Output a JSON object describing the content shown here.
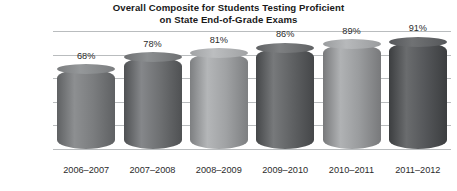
{
  "chart_data": {
    "type": "bar",
    "title": "Overall Composite for Students Testing Proficient on State End-of-Grade Exams",
    "title_lines": [
      "Overall Composite for Students Testing Proficient",
      "on State End-of-Grade Exams"
    ],
    "xlabel": "",
    "ylabel": "",
    "categories": [
      "2006–2007",
      "2007–2008",
      "2008–2009",
      "2009–2010",
      "2010–2011",
      "2011–2012"
    ],
    "values": [
      68,
      78,
      81,
      86,
      89,
      91
    ],
    "data_labels": [
      "68%",
      "78%",
      "81%",
      "86%",
      "89%",
      "91%"
    ],
    "ylim": [
      0,
      100
    ],
    "ytick_values": [
      0,
      20,
      40,
      60,
      80,
      100
    ],
    "ytick_labels": [
      "0%",
      "20%",
      "40%",
      "60%",
      "80%",
      "100%"
    ],
    "grid": true,
    "grid_color": "#b9bcbe",
    "legend": null,
    "legend_position": "none",
    "bar_style": "cylinder",
    "series": [
      {
        "name": "Overall Composite Percent Proficient",
        "values": [
          68,
          78,
          81,
          86,
          89,
          91
        ]
      }
    ],
    "bar_colors": [
      {
        "light": "#8d8f91",
        "mid": "#7b7d7f",
        "dark": "#5f6163",
        "cap": "#95989a"
      },
      {
        "light": "#85878a",
        "mid": "#6e7072",
        "dark": "#4f5153",
        "cap": "#8c8f91"
      },
      {
        "light": "#b4b6b8",
        "mid": "#a0a2a4",
        "dark": "#7d7f81",
        "cap": "#bcbec0"
      },
      {
        "light": "#77797b",
        "mid": "#606264",
        "dark": "#454749",
        "cap": "#7e8082",
        "hasShine": true
      },
      {
        "light": "#b0b2b4",
        "mid": "#9a9c9e",
        "dark": "#78797b",
        "cap": "#b7b9bb"
      },
      {
        "light": "#6a6c6e",
        "mid": "#55575a",
        "dark": "#3c3e40",
        "cap": "#707274"
      }
    ]
  }
}
